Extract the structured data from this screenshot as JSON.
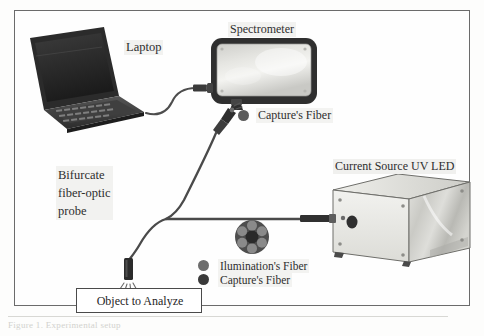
{
  "figure": {
    "type": "schematic-diagram",
    "caption_fragment": "Figure 1. Experimental setup"
  },
  "labels": {
    "laptop": "Laptop",
    "spectrometer": "Spectrometer",
    "uv_led": "Current Source UV LED",
    "probe_line1": "Bifurcate",
    "probe_line2": "fiber-optic",
    "probe_line3": "probe",
    "capture_fiber_top": "Capture's Fiber",
    "object_to_analyze": "Object to Analyze"
  },
  "legend": {
    "items": [
      {
        "label": "Ilumination's Fiber",
        "color": "#6d6d6d",
        "marker": "filled-circle"
      },
      {
        "label": "Capture's Fiber",
        "color": "#3a3a3a",
        "marker": "filled-circle"
      }
    ]
  },
  "components": [
    {
      "name": "laptop",
      "icon": "laptop-icon",
      "description": "dark notebook computer, three-quarter view, open lid with screen and keyboard"
    },
    {
      "name": "usb-cable",
      "icon": "cable-icon",
      "description": "curved cable from laptop to spectrometer USB port"
    },
    {
      "name": "spectrometer",
      "icon": "spectrometer-icon",
      "description": "rounded rectangular instrument with dark bezel and light gradient top face"
    },
    {
      "name": "fiber-connector",
      "icon": "fiber-connector-icon",
      "description": "SMA connector entering the spectrometer underside"
    },
    {
      "name": "bifurcated-fiber",
      "icon": "fiber-bundle-icon",
      "description": "Y-shaped fiber bundle splitting toward spectrometer and UV LED source"
    },
    {
      "name": "fiber-cross-section",
      "icon": "fiber-cross-section-icon",
      "description": "bundle end-face: one dark central capture fiber ringed by six lighter illumination fibers"
    },
    {
      "name": "probe-tip",
      "icon": "probe-tip-icon",
      "description": "fiber probe tip emitting light rays onto the sample"
    },
    {
      "name": "uv-led-enclosure",
      "icon": "enclosure-icon",
      "description": "rectangular metal box in perspective with front panel, output port and corner screws"
    }
  ],
  "colors": {
    "frame_border": "#6b6b6b",
    "ink": "#2e2e2e",
    "device_dark": "#3a3a3a",
    "metal_light": "#d6d6d2",
    "background": "#fefefe"
  }
}
